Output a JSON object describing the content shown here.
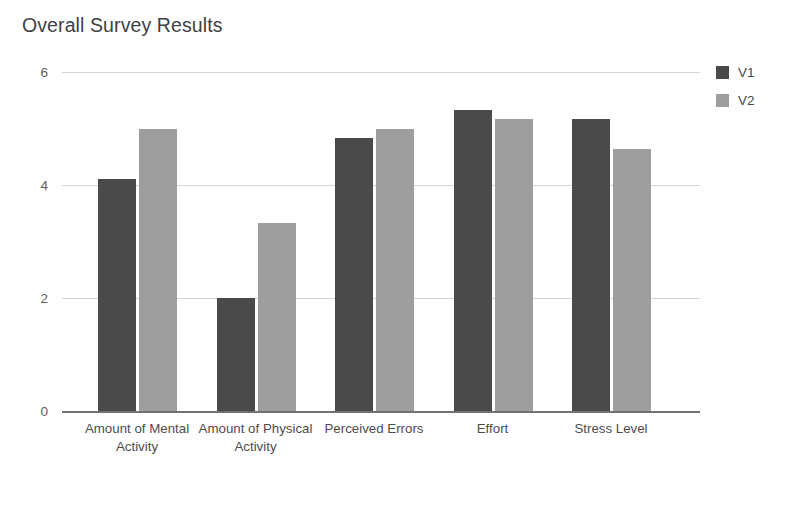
{
  "chart_data": {
    "type": "bar",
    "title": "Overall Survey Results",
    "xlabel": "",
    "ylabel": "",
    "ylim": [
      0,
      6
    ],
    "yticks": [
      "0",
      "2",
      "4",
      "6"
    ],
    "ytick_values": [
      0,
      2,
      4,
      6
    ],
    "grid": true,
    "legend_position": "right",
    "categories": [
      "Amount of Mental Activity",
      "Amount of Physical Activity",
      "Perceived Errors",
      "Effort",
      "Stress Level"
    ],
    "series": [
      {
        "name": "V1",
        "color": "#4a4a4a",
        "values": [
          4.11,
          2.0,
          4.83,
          5.33,
          5.17
        ]
      },
      {
        "name": "V2",
        "color": "#9e9e9e",
        "values": [
          5.0,
          3.33,
          5.0,
          5.17,
          4.63
        ]
      }
    ]
  },
  "legend": {
    "items": [
      {
        "label": "V1",
        "color": "#4a4a4a"
      },
      {
        "label": "V2",
        "color": "#9e9e9e"
      }
    ]
  },
  "axis": {
    "gridline_color": "#d4d4d4",
    "axis_color": "#6f7174"
  }
}
